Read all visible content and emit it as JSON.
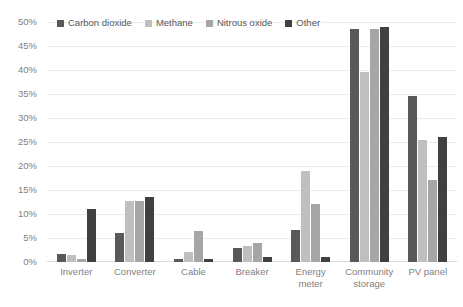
{
  "chart_data": {
    "type": "bar",
    "title": "",
    "subtitle": "",
    "xlabel": "",
    "ylabel": "",
    "ylim": [
      0,
      50
    ],
    "ytick_labels": [
      "50%",
      "45%",
      "40%",
      "35%",
      "30%",
      "25%",
      "20%",
      "15%",
      "10%",
      "5%",
      "0%"
    ],
    "ytick_values": [
      50,
      45,
      40,
      35,
      30,
      25,
      20,
      15,
      10,
      5,
      0
    ],
    "grid": true,
    "legend_position": "top-left",
    "categories": [
      "Inverter",
      "Converter",
      "Cable",
      "Breaker",
      "Energy meter",
      "Community storage",
      "PV panel"
    ],
    "category_lines": [
      [
        "Inverter"
      ],
      [
        "Converter"
      ],
      [
        "Cable"
      ],
      [
        "Breaker"
      ],
      [
        "Energy",
        "meter"
      ],
      [
        "Community",
        "storage"
      ],
      [
        "PV panel"
      ]
    ],
    "series": [
      {
        "name": "Carbon dioxide",
        "color": "#595959",
        "values": [
          1.7,
          6.0,
          0.7,
          3.0,
          6.7,
          48.5,
          34.5
        ]
      },
      {
        "name": "Methane",
        "color": "#bfbfbf",
        "values": [
          1.5,
          12.8,
          2.0,
          3.3,
          19.0,
          39.5,
          25.5
        ]
      },
      {
        "name": "Nitrous oxide",
        "color": "#a6a6a6",
        "values": [
          0.6,
          12.8,
          6.5,
          4.0,
          12.0,
          48.5,
          17.0
        ]
      },
      {
        "name": "Other",
        "color": "#404040",
        "values": [
          11.0,
          13.5,
          0.6,
          1.0,
          1.0,
          49.0,
          26.0
        ]
      }
    ]
  },
  "colors": {
    "gridline": "#ebebeb",
    "axis_text": "#7f7f7f",
    "legend_text": "#595959",
    "background": "#ffffff"
  }
}
